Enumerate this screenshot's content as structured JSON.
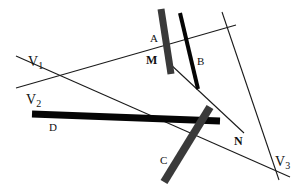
{
  "diagram": {
    "width": 307,
    "height": 193,
    "background": "#ffffff",
    "thin_lines": [
      {
        "name": "line-v1-v3",
        "x1": 16,
        "y1": 56,
        "x2": 290,
        "y2": 177
      },
      {
        "name": "line-v2",
        "x1": 16,
        "y1": 88,
        "x2": 236,
        "y2": 25
      },
      {
        "name": "line-right",
        "x1": 222,
        "y1": 12,
        "x2": 279,
        "y2": 180
      },
      {
        "name": "line-m-n",
        "x1": 169,
        "y1": 63,
        "x2": 244,
        "y2": 133
      }
    ],
    "bars": [
      {
        "name": "bar-a",
        "label": "A",
        "x1": 161,
        "y1": 9,
        "x2": 171,
        "y2": 74,
        "width": 7,
        "color": "#3a3a3a"
      },
      {
        "name": "bar-b",
        "label": "B",
        "x1": 180,
        "y1": 13,
        "x2": 198,
        "y2": 89,
        "width": 4,
        "color": "#050505"
      },
      {
        "name": "bar-d",
        "label": "D",
        "x1": 32,
        "y1": 114,
        "x2": 220,
        "y2": 121,
        "width": 7,
        "color": "#050505"
      },
      {
        "name": "bar-c",
        "label": "C",
        "x1": 210,
        "y1": 107,
        "x2": 164,
        "y2": 182,
        "width": 8,
        "color": "#3a3a3a"
      }
    ],
    "labels": [
      {
        "name": "label-v1",
        "text": "V",
        "sub": "1",
        "x": 28,
        "y": 66,
        "size": 14
      },
      {
        "name": "label-v2",
        "text": "V",
        "sub": "2",
        "x": 26,
        "y": 104,
        "size": 14
      },
      {
        "name": "label-v3",
        "text": "V",
        "sub": "3",
        "x": 275,
        "y": 166,
        "size": 14
      },
      {
        "name": "label-a",
        "text": "A",
        "x": 150,
        "y": 42,
        "size": 11
      },
      {
        "name": "label-b",
        "text": "B",
        "x": 197,
        "y": 65,
        "size": 11
      },
      {
        "name": "label-m",
        "text": "M",
        "x": 146,
        "y": 64,
        "size": 12,
        "bold": true
      },
      {
        "name": "label-n",
        "text": "N",
        "x": 234,
        "y": 145,
        "size": 12,
        "bold": true
      },
      {
        "name": "label-c",
        "text": "C",
        "x": 160,
        "y": 164,
        "size": 11
      },
      {
        "name": "label-d",
        "text": "D",
        "x": 49,
        "y": 131,
        "size": 11
      }
    ]
  }
}
